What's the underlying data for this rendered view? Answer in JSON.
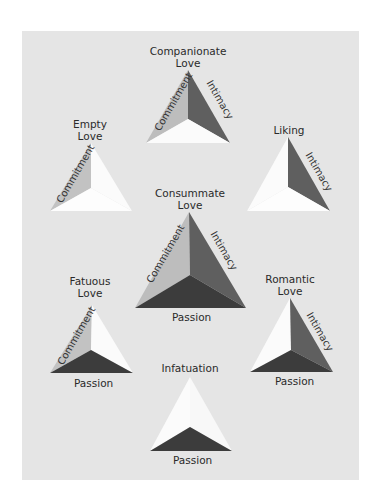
{
  "colors": {
    "background": "#ffffff",
    "panel": "#e5e5e5",
    "commitment_face": "#bdbdbd",
    "intimacy_face": "#5f5f5f",
    "passion_face": "#3c3c3c",
    "empty_face": "#fbfbfb"
  },
  "diagram": {
    "title": "",
    "components": [
      "Commitment",
      "Intimacy",
      "Passion"
    ],
    "triangles": [
      {
        "id": "companionate",
        "title_line1": "Companionate",
        "title_line2": "Love",
        "labels": {
          "commitment": "Commitment",
          "intimacy": "Intimacy"
        }
      },
      {
        "id": "empty",
        "title_line1": "Empty",
        "title_line2": "Love",
        "labels": {
          "commitment": "Commitment"
        }
      },
      {
        "id": "liking",
        "title_line1": "Liking",
        "title_line2": "",
        "labels": {
          "intimacy": "Intimacy"
        }
      },
      {
        "id": "consummate",
        "title_line1": "Consummate",
        "title_line2": "Love",
        "labels": {
          "commitment": "Commitment",
          "intimacy": "Intimacy",
          "passion": "Passion"
        }
      },
      {
        "id": "fatuous",
        "title_line1": "Fatuous",
        "title_line2": "Love",
        "labels": {
          "commitment": "Commitment",
          "passion": "Passion"
        }
      },
      {
        "id": "romantic",
        "title_line1": "Romantic",
        "title_line2": "Love",
        "labels": {
          "intimacy": "Intimacy",
          "passion": "Passion"
        }
      },
      {
        "id": "infatuation",
        "title_line1": "Infatuation",
        "title_line2": "",
        "labels": {
          "passion": "Passion"
        }
      }
    ]
  }
}
